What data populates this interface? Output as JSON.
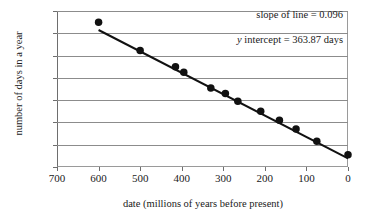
{
  "chart_data": {
    "type": "scatter",
    "title": "",
    "xlabel": "date (millions of years before present)",
    "ylabel": "number of days in a year",
    "xlim": [
      700,
      0
    ],
    "ylim": [
      360,
      430
    ],
    "x_ticks": [
      700,
      600,
      500,
      400,
      300,
      200,
      100,
      0
    ],
    "y_ticks": [
      360,
      370,
      380,
      390,
      400,
      410,
      420,
      430
    ],
    "x_axis_reversed": true,
    "grid": "horizontal",
    "legend": "none",
    "marker": {
      "shape": "circle",
      "color": "#111111",
      "size": 6
    },
    "x": [
      600,
      500,
      415,
      395,
      330,
      295,
      265,
      210,
      165,
      125,
      75,
      0
    ],
    "values": [
      425.0,
      412.3,
      405.0,
      402.5,
      395.5,
      393.0,
      389.5,
      385.0,
      381.0,
      377.0,
      371.5,
      365.5
    ],
    "points": [
      {
        "x": 600,
        "y": 425.0
      },
      {
        "x": 500,
        "y": 412.3
      },
      {
        "x": 415,
        "y": 405.0
      },
      {
        "x": 395,
        "y": 402.5
      },
      {
        "x": 330,
        "y": 395.5
      },
      {
        "x": 295,
        "y": 393.0
      },
      {
        "x": 265,
        "y": 389.5
      },
      {
        "x": 210,
        "y": 385.0
      },
      {
        "x": 165,
        "y": 381.0
      },
      {
        "x": 125,
        "y": 377.0
      },
      {
        "x": 75,
        "y": 371.5
      },
      {
        "x": 0,
        "y": 365.5
      }
    ],
    "fit_line": {
      "slope": 0.096,
      "intercept": 363.87,
      "x_start": 600,
      "x_end": 0,
      "color": "#111111"
    },
    "annotations": {
      "slope_text": "slope of line = 0.096",
      "intercept_text_prefix": "y",
      "intercept_text_rest": " intercept = 363.87 days"
    }
  }
}
